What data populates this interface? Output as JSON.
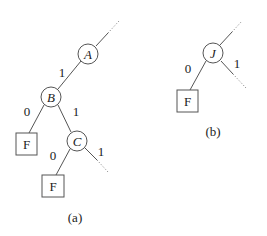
{
  "diagram": {
    "type": "binary-trie-fragments",
    "colors": {
      "stroke": "#555555",
      "text": "#222222",
      "background": "#ffffff"
    },
    "subfigures": [
      {
        "id": "a",
        "caption": "(a)",
        "nodes": [
          {
            "id": "A",
            "label": "A",
            "kind": "internal"
          },
          {
            "id": "B",
            "label": "B",
            "kind": "internal"
          },
          {
            "id": "C",
            "label": "C",
            "kind": "internal"
          },
          {
            "id": "F1",
            "label": "F",
            "kind": "leaf"
          },
          {
            "id": "F2",
            "label": "F",
            "kind": "leaf"
          }
        ],
        "edges": [
          {
            "from": "parent",
            "to": "A",
            "label": "",
            "style": "dotted-continuation"
          },
          {
            "from": "A",
            "to": "B",
            "label": "1"
          },
          {
            "from": "B",
            "to": "F1",
            "label": "0"
          },
          {
            "from": "B",
            "to": "C",
            "label": "1"
          },
          {
            "from": "C",
            "to": "F2",
            "label": "0"
          },
          {
            "from": "C",
            "to": "subtree",
            "label": "1",
            "style": "dotted-continuation"
          }
        ]
      },
      {
        "id": "b",
        "caption": "(b)",
        "nodes": [
          {
            "id": "J",
            "label": "J",
            "kind": "internal"
          },
          {
            "id": "F3",
            "label": "F",
            "kind": "leaf"
          }
        ],
        "edges": [
          {
            "from": "parent",
            "to": "J",
            "label": "",
            "style": "dotted-continuation"
          },
          {
            "from": "J",
            "to": "F3",
            "label": "0"
          },
          {
            "from": "J",
            "to": "subtree",
            "label": "1",
            "style": "dotted-continuation"
          }
        ]
      }
    ]
  }
}
